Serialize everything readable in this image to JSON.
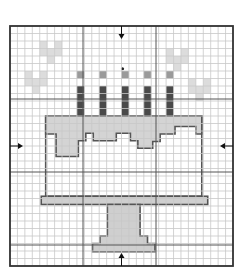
{
  "pattern": {
    "title": "Birthday cake cross-stitch chart",
    "grid": {
      "cols": 30,
      "rows": 32,
      "cell": 7.4,
      "origin_x": 10,
      "origin_y": 26,
      "bold_every": 10
    },
    "colors": {
      "background": "#ffffff",
      "grid_fine": "#c8c8c8",
      "grid_bold": "#555555",
      "border": "#333333",
      "heart": "#dcdcdc",
      "frosting": "#d4d4d4",
      "candle": "#4a4a4a",
      "flame": "#9a9a9a",
      "outline": "#555555",
      "stand": "#cfcfcf",
      "arrow": "#111111"
    },
    "center_markers": [
      "top",
      "bottom",
      "left",
      "right"
    ],
    "candles_count": 5,
    "hearts_count": 4
  }
}
